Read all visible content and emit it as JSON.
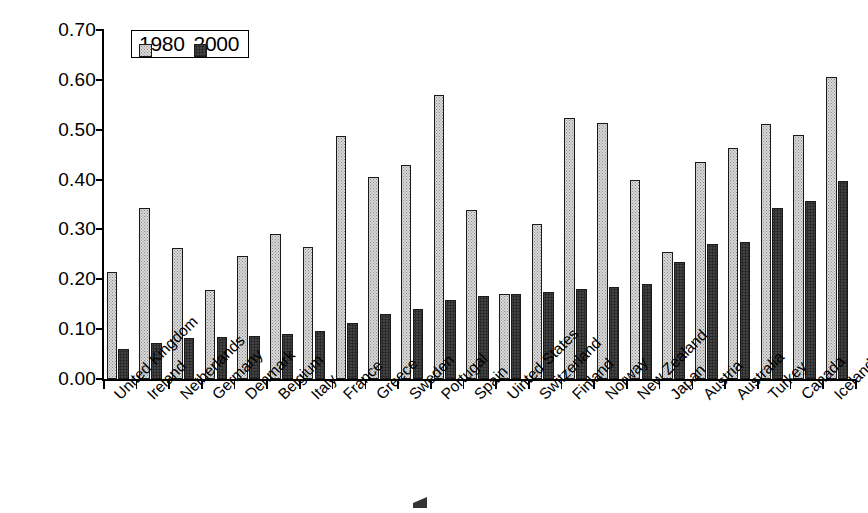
{
  "chart_data": {
    "type": "bar",
    "title": "",
    "xlabel": "",
    "ylabel": "",
    "ylim": [
      0.0,
      0.7
    ],
    "ytick_labels": [
      "0.00",
      "0.10",
      "0.20",
      "0.30",
      "0.40",
      "0.50",
      "0.60",
      "0.70"
    ],
    "ytick_values": [
      0.0,
      0.1,
      0.2,
      0.3,
      0.4,
      0.5,
      0.6,
      0.7
    ],
    "grid": false,
    "legend_position": "top-left-inside",
    "categories": [
      "United Kingdom",
      "Ireland",
      "Netherlands",
      "Germany",
      "Denmark",
      "Belgium",
      "Italy",
      "France",
      "Greece",
      "Sweden",
      "Portugal",
      "Spain",
      "Uinted States",
      "Switzerland",
      "Finland",
      "Norway",
      "New Zealand",
      "Japan",
      "Austria",
      "Australia",
      "Turkey",
      "Canada",
      "Iceland"
    ],
    "series": [
      {
        "name": "1980",
        "values": [
          0.215,
          0.343,
          0.262,
          0.179,
          0.246,
          0.291,
          0.264,
          0.487,
          0.405,
          0.43,
          0.57,
          0.338,
          0.171,
          0.31,
          0.524,
          0.513,
          0.399,
          0.255,
          0.436,
          0.464,
          0.511,
          0.489,
          0.605
        ]
      },
      {
        "name": "2000",
        "values": [
          0.061,
          0.073,
          0.082,
          0.084,
          0.087,
          0.09,
          0.097,
          0.112,
          0.131,
          0.141,
          0.158,
          0.166,
          0.17,
          0.174,
          0.18,
          0.184,
          0.191,
          0.235,
          0.27,
          0.275,
          0.343,
          0.357,
          0.398
        ]
      }
    ]
  },
  "legend": {
    "items": [
      {
        "label": "1980",
        "swatch": "light-stipple-swatch"
      },
      {
        "label": "2000",
        "swatch": "dark-stipple-swatch"
      }
    ]
  }
}
